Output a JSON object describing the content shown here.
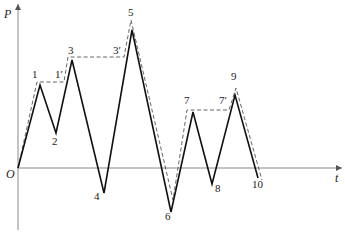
{
  "axes": {
    "y_label": "P",
    "x_label": "t",
    "origin_label": "O",
    "axis_color": "#888888"
  },
  "solid_path": {
    "color": "#111111",
    "points": [
      [
        18,
        168
      ],
      [
        40,
        85
      ],
      [
        56,
        133
      ],
      [
        72,
        60
      ],
      [
        104,
        193
      ],
      [
        132,
        30
      ],
      [
        171,
        212
      ],
      [
        193,
        112
      ],
      [
        212,
        184
      ],
      [
        235,
        95
      ],
      [
        258,
        178
      ]
    ]
  },
  "dashed_path": {
    "color": "#555555",
    "points": [
      [
        18,
        168
      ],
      [
        37,
        82
      ],
      [
        64,
        82
      ],
      [
        68,
        57
      ],
      [
        124,
        57
      ],
      [
        131,
        20
      ],
      [
        173,
        200
      ],
      [
        187,
        110
      ],
      [
        229,
        110
      ],
      [
        236,
        88
      ],
      [
        262,
        180
      ]
    ]
  },
  "point_labels": [
    {
      "text": "1",
      "x": 32,
      "y": 78
    },
    {
      "text": "2",
      "x": 52,
      "y": 145
    },
    {
      "text": "3",
      "x": 68,
      "y": 54
    },
    {
      "text": "1′",
      "x": 55,
      "y": 78
    },
    {
      "text": "3′",
      "x": 113,
      "y": 54
    },
    {
      "text": "4",
      "x": 94,
      "y": 200
    },
    {
      "text": "5",
      "x": 128,
      "y": 16
    },
    {
      "text": "6",
      "x": 165,
      "y": 220
    },
    {
      "text": "7",
      "x": 184,
      "y": 104
    },
    {
      "text": "7′",
      "x": 219,
      "y": 104
    },
    {
      "text": "8",
      "x": 215,
      "y": 192
    },
    {
      "text": "9",
      "x": 231,
      "y": 80
    },
    {
      "text": "10",
      "x": 252,
      "y": 188
    }
  ]
}
